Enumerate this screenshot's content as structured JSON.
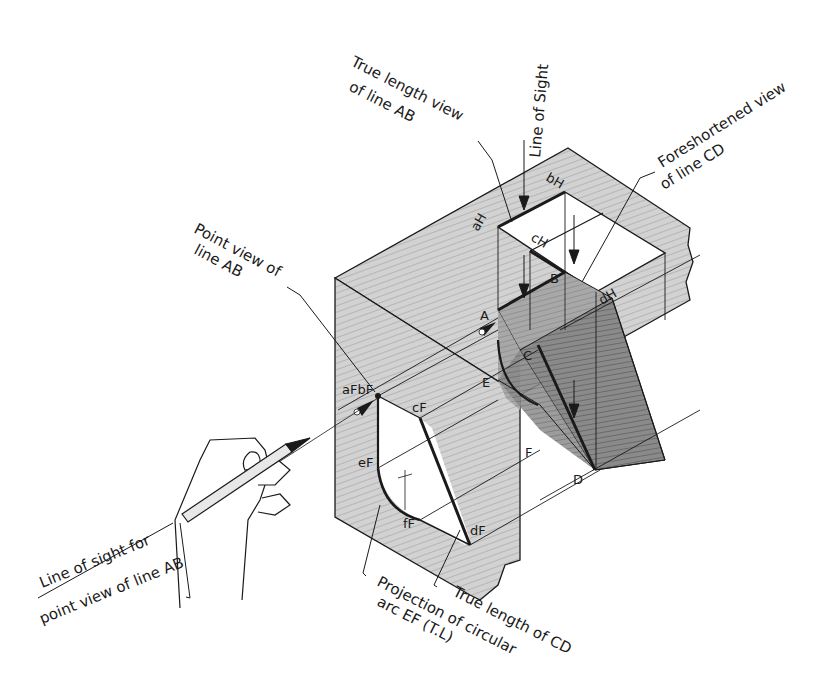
{
  "labels": {
    "line_of_sight": "Line of Sight",
    "true_length_view_l1": "True  length view",
    "true_length_view_l2": "of line AB",
    "foreshortened_l1": "Foreshortened view",
    "foreshortened_l2": "of line CD",
    "point_view_l1": "Point  view of",
    "point_view_l2": "line AB",
    "los_point_view_l1": "Line of sight for",
    "los_point_view_l2": "point view of line AB",
    "projection_l1": "Projection of circular",
    "projection_l2": "arc EF (T.L)",
    "true_length_cd": "True length of CD"
  },
  "points": {
    "aH": "aH",
    "bH": "bH",
    "cH": "cH",
    "dH": "dH",
    "A": "A",
    "B": "B",
    "C": "C",
    "D": "D",
    "E": "E",
    "F": "F",
    "aF_bF": "aFbF",
    "cF_upper": "cF",
    "eF": "eF",
    "fF": "fF",
    "dF": "dF"
  },
  "colors": {
    "shading_light": "#c9c9c9",
    "shading_mid": "#b0b0b0",
    "shading_dark": "#7a7a7a",
    "ink": "#1a1a1a",
    "paper": "#ffffff"
  }
}
